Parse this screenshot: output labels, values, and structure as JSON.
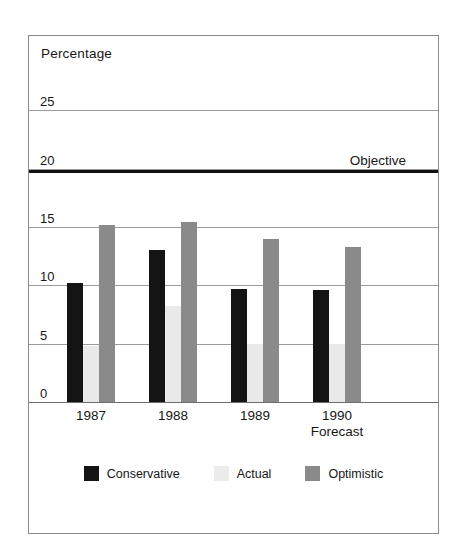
{
  "chart_data": {
    "type": "bar",
    "title": "Percentage",
    "ylabel": "Percentage",
    "xlabel": "",
    "categories": [
      "1987",
      "1988",
      "1989",
      "1990"
    ],
    "category_sublabels": [
      "",
      "",
      "",
      "Forecast"
    ],
    "series": [
      {
        "name": "Conservative",
        "color": "#141414",
        "values": [
          10.2,
          13.0,
          9.7,
          9.6
        ]
      },
      {
        "name": "Actual",
        "color": "#e9e9e9",
        "values": [
          4.8,
          8.2,
          5.0,
          5.0
        ]
      },
      {
        "name": "Optimistic",
        "color": "#8a8a8a",
        "values": [
          15.2,
          15.4,
          14.0,
          13.3
        ]
      }
    ],
    "ylim": [
      0,
      27.5
    ],
    "yticks": [
      0,
      5,
      10,
      15,
      20,
      25
    ],
    "ytick_labels": [
      "0",
      "5",
      "10",
      "15",
      "20",
      "25"
    ],
    "grid": true,
    "legend_position": "bottom",
    "annotations": [
      {
        "type": "hline",
        "label": "Objective",
        "value": 20,
        "color": "#111111"
      }
    ]
  },
  "axis": {
    "title": "Percentage",
    "ticks": [
      {
        "label": "25",
        "value": 25
      },
      {
        "label": "20",
        "value": 20
      },
      {
        "label": "15",
        "value": 15
      },
      {
        "label": "10",
        "value": 10
      },
      {
        "label": "5",
        "value": 5
      },
      {
        "label": "0",
        "value": 0
      }
    ]
  },
  "objective": {
    "label": "Objective",
    "value": 20
  },
  "xaxis": {
    "categories": [
      {
        "label": "1987",
        "sub": ""
      },
      {
        "label": "1988",
        "sub": ""
      },
      {
        "label": "1989",
        "sub": ""
      },
      {
        "label": "1990",
        "sub": "Forecast"
      }
    ]
  },
  "legend": {
    "items": [
      {
        "label": "Conservative",
        "key": "conservative"
      },
      {
        "label": "Actual",
        "key": "actual"
      },
      {
        "label": "Optimistic",
        "key": "optimistic"
      }
    ]
  }
}
